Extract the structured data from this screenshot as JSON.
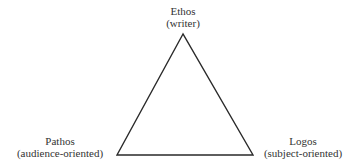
{
  "diagram": {
    "type": "rhetorical-triangle",
    "vertices": {
      "top": {
        "name": "Ethos",
        "descriptor": "(writer)"
      },
      "bottom_left": {
        "name": "Pathos",
        "descriptor": "(audience-oriented)"
      },
      "bottom_right": {
        "name": "Logos",
        "descriptor": "(subject-oriented)"
      }
    },
    "colors": {
      "line": "#2a2a2a",
      "text": "#333333",
      "background": "#ffffff"
    }
  }
}
